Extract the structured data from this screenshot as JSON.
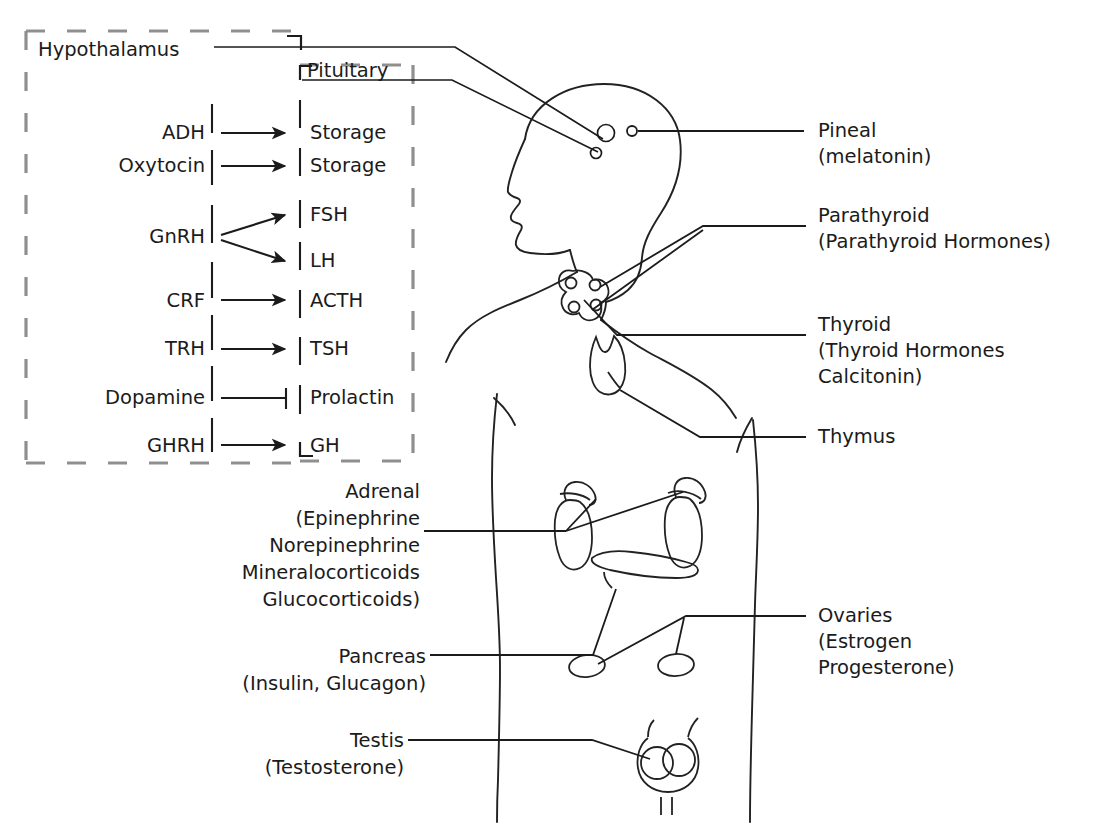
{
  "diagram": {
    "title_present": false,
    "type": "endocrine-system-anatomical-diagram",
    "colors": {
      "ink": "#1b1b1b",
      "dashed_border": "#8f8f8f",
      "leader_line": "#6e6e6e",
      "body_outline": "#222222",
      "background": "#ffffff"
    }
  },
  "hypothalamus_box": {
    "label": "Hypothalamus",
    "releasing_factors": [
      "ADH",
      "Oxytocin",
      "GnRH",
      "CRF",
      "TRH",
      "Dopamine",
      "GHRH"
    ]
  },
  "pituitary_box": {
    "label": "Pituitary",
    "hormones": [
      "Storage",
      "Storage",
      "FSH",
      "LH",
      "ACTH",
      "TSH",
      "Prolactin",
      "GH"
    ]
  },
  "pathways": [
    {
      "from": "ADH",
      "to": "Storage",
      "kind": "stimulates"
    },
    {
      "from": "Oxytocin",
      "to": "Storage",
      "kind": "stimulates"
    },
    {
      "from": "GnRH",
      "to": "FSH",
      "kind": "stimulates"
    },
    {
      "from": "GnRH",
      "to": "LH",
      "kind": "stimulates"
    },
    {
      "from": "CRF",
      "to": "ACTH",
      "kind": "stimulates"
    },
    {
      "from": "TRH",
      "to": "TSH",
      "kind": "stimulates"
    },
    {
      "from": "Dopamine",
      "to": "Prolactin",
      "kind": "inhibits"
    },
    {
      "from": "GHRH",
      "to": "GH",
      "kind": "stimulates"
    }
  ],
  "gland_labels": {
    "pineal": {
      "name": "Pineal",
      "hormones": "(melatonin)"
    },
    "parathyroid": {
      "name": "Parathyroid",
      "hormones": "(Parathyroid Hormones)"
    },
    "thyroid": {
      "name": "Thyroid",
      "hormones_line1": "(Thyroid Hormones",
      "hormones_line2": "Calcitonin)"
    },
    "thymus": {
      "name": "Thymus"
    },
    "ovaries": {
      "name": "Ovaries",
      "hormones_line1": "(Estrogen",
      "hormones_line2": "Progesterone)"
    },
    "adrenal": {
      "name": "Adrenal",
      "hormones_line1": "(Epinephrine",
      "hormones_line2": "Norepinephrine",
      "hormones_line3": "Mineralocorticoids",
      "hormones_line4": "Glucocorticoids)"
    },
    "pancreas": {
      "name": "Pancreas",
      "hormones": "(Insulin, Glucagon)"
    },
    "testis": {
      "name": "Testis",
      "hormones": "(Testosterone)"
    }
  }
}
